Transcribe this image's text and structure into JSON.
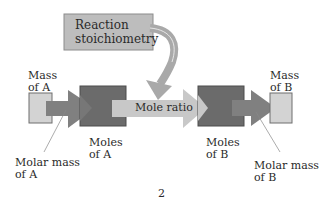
{
  "diagram": {
    "reaction_box": {
      "line1": "Reaction",
      "line2": "stoichiometry"
    },
    "mass_a": {
      "line1": "Mass",
      "line2": "of A"
    },
    "mass_b": {
      "line1": "Mass",
      "line2": "of B"
    },
    "moles_a": {
      "line1": "Moles",
      "line2": "of A"
    },
    "moles_b": {
      "line1": "Moles",
      "line2": "of B"
    },
    "mole_ratio": "Mole ratio",
    "molar_mass_a": {
      "line1": "Molar mass",
      "line2": "of A"
    },
    "molar_mass_b": {
      "line1": "Molar mass",
      "line2": "of B"
    },
    "page_number": "2"
  },
  "colors": {
    "light_box": "#d3d3d3",
    "dark_box": "#6b6b6b",
    "mid_arrow": "#808080",
    "light_arrow": "#c8c8c8",
    "reaction_box": "#bdbdbd",
    "text": "#2a2a2a"
  }
}
